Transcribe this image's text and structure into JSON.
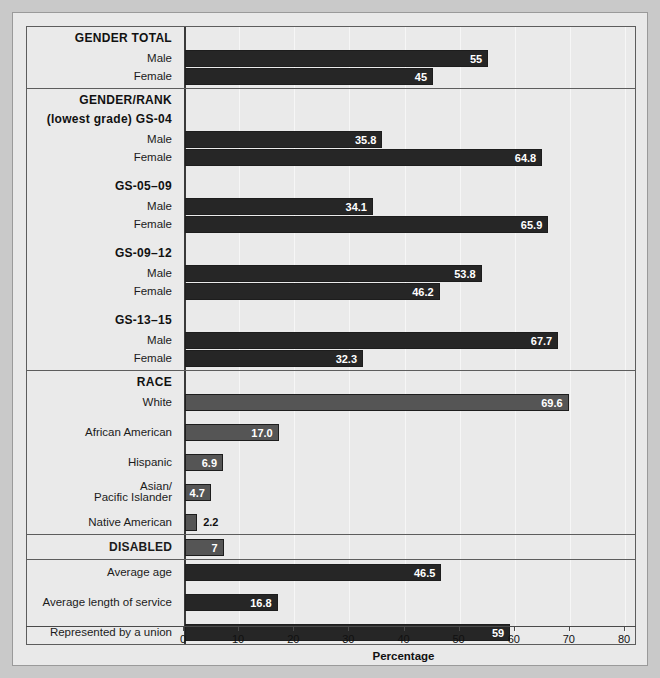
{
  "chart_data": {
    "type": "bar",
    "orientation": "horizontal",
    "title": "",
    "xlabel": "Percentage",
    "ylabel": "",
    "xlim": [
      0,
      80
    ],
    "xticks": [
      0,
      10,
      20,
      30,
      40,
      50,
      60,
      70,
      80
    ],
    "grid": true,
    "legend": "none",
    "colors": {
      "dark_bar": "#262626",
      "gray_bar": "#555555",
      "panel_background": "#eaeaea",
      "figure_background": "#e9e9e9",
      "page_background": "#c9c9c9",
      "border": "#5d5d5d",
      "axis": "#3a3a3a",
      "gridline": "#f6f6f6",
      "value_label_inside": "#ffffff",
      "value_label_outside": "#111111"
    },
    "sections": [
      {
        "name": "gender-total",
        "heading": "GENDER TOTAL",
        "subheading": "",
        "rows": [
          {
            "label": "Male",
            "value": 55,
            "display": "55",
            "style": "dark",
            "label_position": "inside"
          },
          {
            "label": "Female",
            "value": 45,
            "display": "45",
            "style": "dark",
            "label_position": "inside"
          }
        ]
      },
      {
        "name": "gender-rank",
        "heading": "GENDER/RANK",
        "subheading": "(lowest grade) GS-04",
        "rows": [
          {
            "label": "Male",
            "value": 35.8,
            "display": "35.8",
            "style": "dark",
            "label_position": "inside"
          },
          {
            "label": "Female",
            "value": 64.8,
            "display": "64.8",
            "style": "dark",
            "label_position": "inside"
          },
          {
            "label": "GS-05–09",
            "group": true
          },
          {
            "label": "Male",
            "value": 34.1,
            "display": "34.1",
            "style": "dark",
            "label_position": "inside"
          },
          {
            "label": "Female",
            "value": 65.9,
            "display": "65.9",
            "style": "dark",
            "label_position": "inside"
          },
          {
            "label": "GS-09–12",
            "group": true
          },
          {
            "label": "Male",
            "value": 53.8,
            "display": "53.8",
            "style": "dark",
            "label_position": "inside"
          },
          {
            "label": "Female",
            "value": 46.2,
            "display": "46.2",
            "style": "dark",
            "label_position": "inside"
          },
          {
            "label": "GS-13–15",
            "group": true
          },
          {
            "label": "Male",
            "value": 67.7,
            "display": "67.7",
            "style": "dark",
            "label_position": "inside"
          },
          {
            "label": "Female",
            "value": 32.3,
            "display": "32.3",
            "style": "dark",
            "label_position": "inside"
          }
        ]
      },
      {
        "name": "race",
        "heading": "RACE",
        "subheading": "",
        "rows": [
          {
            "label": "White",
            "value": 69.6,
            "display": "69.6",
            "style": "gray",
            "label_position": "inside"
          },
          {
            "label": "African American",
            "value": 17.0,
            "display": "17.0",
            "style": "gray",
            "label_position": "inside"
          },
          {
            "label": "Hispanic",
            "value": 6.9,
            "display": "6.9",
            "style": "gray",
            "label_position": "inside"
          },
          {
            "label": "Asian/\nPacific Islander",
            "value": 4.7,
            "display": "4.7",
            "style": "gray",
            "label_position": "inside"
          },
          {
            "label": "Native American",
            "value": 2.2,
            "display": "2.2",
            "style": "gray",
            "label_position": "outside"
          }
        ]
      },
      {
        "name": "disabled",
        "heading": "DISABLED",
        "subheading": "",
        "rows": [
          {
            "label": "DISABLED",
            "value": 7,
            "display": "7",
            "style": "gray",
            "label_position": "inside",
            "heading_row": true
          }
        ]
      },
      {
        "name": "other-measures",
        "heading": "",
        "subheading": "",
        "rows": [
          {
            "label": "Average age",
            "value": 46.5,
            "display": "46.5",
            "style": "dark",
            "label_position": "inside"
          },
          {
            "label": "Average length of service",
            "value": 16.8,
            "display": "16.8",
            "style": "dark",
            "label_position": "inside"
          },
          {
            "label": "Represented by a union",
            "value": 59,
            "display": "59",
            "style": "dark",
            "label_position": "inside"
          }
        ]
      }
    ]
  },
  "axis": {
    "title": "Percentage",
    "tick_labels": [
      "0",
      "10",
      "20",
      "30",
      "40",
      "50",
      "60",
      "70",
      "80"
    ]
  },
  "headings": {
    "gender_total": "GENDER TOTAL",
    "gender_rank": "GENDER/RANK",
    "gender_rank_sub": "(lowest grade) GS-04",
    "race": "RACE",
    "disabled": "DISABLED"
  }
}
